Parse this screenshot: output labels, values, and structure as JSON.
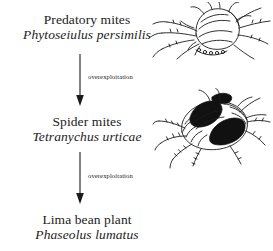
{
  "diagram": {
    "type": "tri-trophic food chain",
    "background_color": "#ffffff",
    "ink_color": "#1b1b1b",
    "nodes": [
      {
        "id": "predator",
        "common_name": "Predatory mites",
        "latin_name": "Phytoseiulus persimilis",
        "illustration": "predatory-mite-drawing"
      },
      {
        "id": "spider-mite",
        "common_name": "Spider mites",
        "latin_name": "Tetranychus urticae",
        "illustration": "spider-mite-drawing"
      },
      {
        "id": "plant",
        "common_name": "Lima bean plant",
        "latin_name": "Phaseolus lumatus",
        "illustration": ""
      }
    ],
    "arrows": [
      {
        "id": "arrow-1",
        "label": "overexploitation",
        "direction": "down",
        "from": "predator",
        "to": "spider-mite"
      },
      {
        "id": "arrow-2",
        "label": "overexploitation",
        "direction": "down",
        "from": "spider-mite",
        "to": "plant"
      }
    ]
  }
}
